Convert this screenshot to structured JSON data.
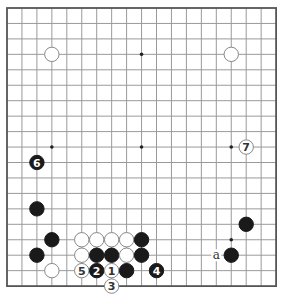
{
  "board": {
    "size": 19,
    "origin_x": 7,
    "origin_y": 8,
    "spacing_x": 14.95,
    "spacing_y": 15.45,
    "stone_radius": 7.2,
    "colors": {
      "grid_line": "#9a9a9a",
      "border": "#555555",
      "black_stone": "#1a1a1a",
      "white_stone_fill": "#ffffff",
      "white_stone_stroke": "#888888",
      "star_point": "#222222",
      "label_on_black": "#ffffff",
      "label_on_white": "#333333",
      "mark_text": "#333333"
    },
    "star_points": [
      [
        3,
        3
      ],
      [
        9,
        3
      ],
      [
        15,
        3
      ],
      [
        3,
        9
      ],
      [
        9,
        9
      ],
      [
        15,
        9
      ],
      [
        3,
        15
      ],
      [
        9,
        15
      ],
      [
        15,
        15
      ]
    ],
    "stones": [
      {
        "col": 3,
        "row": 3,
        "color": "white",
        "label": ""
      },
      {
        "col": 15,
        "row": 3,
        "color": "white",
        "label": ""
      },
      {
        "col": 2,
        "row": 10,
        "color": "black",
        "label": "6"
      },
      {
        "col": 16,
        "row": 9,
        "color": "white",
        "label": "7"
      },
      {
        "col": 2,
        "row": 13,
        "color": "black",
        "label": ""
      },
      {
        "col": 16,
        "row": 14,
        "color": "black",
        "label": ""
      },
      {
        "col": 3,
        "row": 15,
        "color": "black",
        "label": ""
      },
      {
        "col": 5,
        "row": 15,
        "color": "white",
        "label": ""
      },
      {
        "col": 6,
        "row": 15,
        "color": "white",
        "label": ""
      },
      {
        "col": 7,
        "row": 15,
        "color": "white",
        "label": ""
      },
      {
        "col": 8,
        "row": 15,
        "color": "white",
        "label": ""
      },
      {
        "col": 9,
        "row": 15,
        "color": "black",
        "label": ""
      },
      {
        "col": 2,
        "row": 16,
        "color": "black",
        "label": ""
      },
      {
        "col": 5,
        "row": 16,
        "color": "white",
        "label": ""
      },
      {
        "col": 6,
        "row": 16,
        "color": "black",
        "label": ""
      },
      {
        "col": 7,
        "row": 16,
        "color": "black",
        "label": ""
      },
      {
        "col": 8,
        "row": 16,
        "color": "white",
        "label": ""
      },
      {
        "col": 9,
        "row": 16,
        "color": "black",
        "label": ""
      },
      {
        "col": 15,
        "row": 16,
        "color": "black",
        "label": ""
      },
      {
        "col": 3,
        "row": 17,
        "color": "white",
        "label": ""
      },
      {
        "col": 5,
        "row": 17,
        "color": "white",
        "label": "5"
      },
      {
        "col": 6,
        "row": 17,
        "color": "black",
        "label": "2"
      },
      {
        "col": 7,
        "row": 17,
        "color": "white",
        "label": "1"
      },
      {
        "col": 8,
        "row": 17,
        "color": "black",
        "label": ""
      },
      {
        "col": 10,
        "row": 17,
        "color": "black",
        "label": "4"
      },
      {
        "col": 7,
        "row": 18,
        "color": "white",
        "label": "3"
      }
    ],
    "marks": [
      {
        "col": 14,
        "row": 16,
        "text": "a"
      }
    ]
  }
}
